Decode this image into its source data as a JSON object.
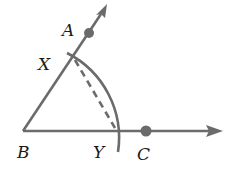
{
  "diagram": {
    "type": "geometric-construction",
    "colors": {
      "line": "#6b6b6b",
      "label": "#1a1a1a",
      "background": "#ffffff"
    },
    "points": {
      "A": {
        "label": "A",
        "x": 89,
        "y": 33
      },
      "B": {
        "label": "B",
        "x": 23,
        "y": 131
      },
      "C": {
        "label": "C",
        "x": 146,
        "y": 131
      },
      "X": {
        "label": "X",
        "x": 74,
        "y": 58
      },
      "Y": {
        "label": "Y",
        "x": 117,
        "y": 131
      }
    },
    "rays": [
      {
        "name": "ray-BA",
        "from": "B",
        "through": "A"
      },
      {
        "name": "ray-BC",
        "from": "B",
        "through": "C"
      }
    ],
    "arc": {
      "center": "B",
      "through": [
        "X",
        "Y"
      ]
    },
    "dashed_segment": {
      "from": "X",
      "to": "Y"
    },
    "labels": {
      "A": "A",
      "B": "B",
      "C": "C",
      "X": "X",
      "Y": "Y"
    }
  }
}
